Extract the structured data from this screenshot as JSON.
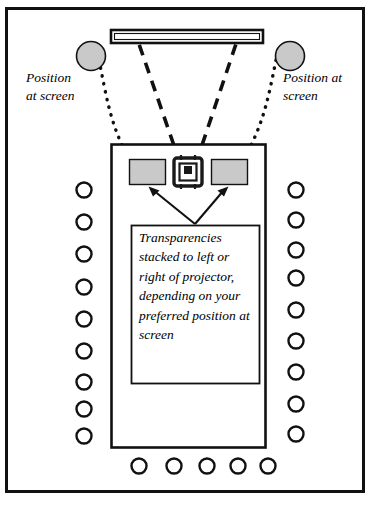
{
  "diagram": {
    "frame": {
      "name": "page-border"
    },
    "screen": {
      "name": "projection-screen"
    },
    "projector": {
      "name": "overhead-projector"
    },
    "table": {
      "name": "presenter-table"
    },
    "caption": {
      "text": "Transparencies stacked to left or right of projector, depending on your preferred position at screen"
    },
    "labels": {
      "left": "Position\nat screen",
      "right": "Position at\nscreen"
    },
    "positions": [
      {
        "id": "position-left",
        "label": "Position at screen"
      },
      {
        "id": "position-right",
        "label": "Position at screen"
      }
    ],
    "transparency_stacks": [
      {
        "id": "stack-left"
      },
      {
        "id": "stack-right"
      }
    ],
    "seating": {
      "left_count": 9,
      "right_count": 9,
      "bottom_count": 5
    },
    "colors": {
      "ink": "#111111",
      "gray_fill": "#c9c9c9",
      "projector_dark": "#1a1a1a",
      "background": "#ffffff"
    }
  }
}
